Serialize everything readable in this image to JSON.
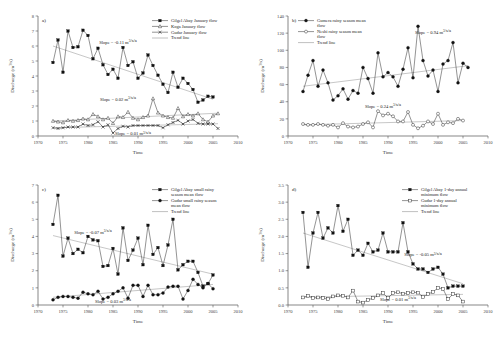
{
  "figure": {
    "axis": {
      "xlabel": "Time",
      "ylabel": "Discharge (m3/s)"
    }
  },
  "chart_data": [
    {
      "type": "line",
      "panel": "a)",
      "title": "",
      "xlabel": "Time",
      "ylabel": "Discharge (m3/s)",
      "xlim": [
        1970,
        2010
      ],
      "ylim": [
        0,
        8
      ],
      "xticks": [
        1970,
        1975,
        1980,
        1985,
        1990,
        1995,
        2000,
        2005,
        2010
      ],
      "yticks": [
        0,
        1,
        2,
        3,
        4,
        5,
        6,
        7,
        8
      ],
      "grid": false,
      "legend_position": "top-right",
      "annotations": [
        {
          "text": "Slope = -0.11 m3/s/a",
          "x": 1986,
          "y": 6.15
        },
        {
          "text": "Slope = 0.02 m3/s/a",
          "x": 1986,
          "y": 2.35
        },
        {
          "text": "Slope = 0.01 m3/s/a",
          "x": 1989,
          "y": 0.05
        }
      ],
      "series": [
        {
          "name": "Gilgel Abay January flow",
          "marker": "filled-square",
          "x": [
            1973,
            1974,
            1975,
            1976,
            1977,
            1978,
            1979,
            1980,
            1981,
            1982,
            1983,
            1984,
            1985,
            1986,
            1987,
            1988,
            1989,
            1990,
            1991,
            1992,
            1993,
            1994,
            1995,
            1996,
            1997,
            1998,
            1999,
            2000,
            2001,
            2002,
            2003,
            2004,
            2005
          ],
          "values": [
            4.9,
            6.4,
            4.25,
            7.0,
            5.9,
            5.95,
            7.05,
            6.7,
            5.15,
            5.85,
            4.75,
            4.1,
            4.45,
            3.85,
            5.9,
            4.7,
            4.95,
            3.85,
            4.2,
            5.4,
            4.7,
            4.05,
            3.45,
            2.9,
            4.25,
            3.25,
            3.85,
            3.5,
            3.1,
            2.25,
            2.4,
            2.65,
            2.6
          ]
        },
        {
          "name": "Koga January flow",
          "marker": "open-triangle",
          "x": [
            1973,
            1974,
            1975,
            1976,
            1977,
            1978,
            1979,
            1980,
            1981,
            1982,
            1983,
            1984,
            1985,
            1986,
            1987,
            1988,
            1989,
            1990,
            1991,
            1992,
            1993,
            1994,
            1995,
            1996,
            1997,
            1998,
            1999,
            2000,
            2001,
            2002,
            2003,
            2004,
            2005,
            2006
          ],
          "values": [
            1.0,
            0.95,
            0.9,
            1.05,
            1.0,
            1.05,
            1.15,
            1.1,
            1.45,
            1.3,
            1.1,
            1.2,
            0.85,
            1.3,
            1.25,
            1.6,
            1.2,
            1.1,
            1.25,
            1.35,
            2.5,
            1.55,
            1.35,
            1.25,
            1.2,
            1.85,
            1.3,
            1.45,
            1.35,
            1.5,
            1.1,
            0.95,
            1.35,
            1.5
          ]
        },
        {
          "name": "Gudar January flow",
          "marker": "cross",
          "x": [
            1973,
            1974,
            1975,
            1976,
            1977,
            1978,
            1979,
            1980,
            1981,
            1982,
            1983,
            1984,
            1985,
            1986,
            1987,
            1988,
            1989,
            1990,
            1991,
            1992,
            1993,
            1994,
            1995,
            1996,
            1997,
            1998,
            1999,
            2000,
            2001,
            2002,
            2003,
            2004,
            2005,
            2006
          ],
          "values": [
            0.55,
            0.5,
            0.55,
            0.6,
            0.6,
            0.6,
            0.8,
            0.7,
            0.75,
            0.95,
            0.6,
            0.75,
            0.2,
            0.5,
            0.65,
            0.6,
            0.7,
            0.7,
            0.7,
            0.7,
            0.7,
            0.7,
            0.55,
            0.75,
            0.9,
            1.05,
            0.8,
            1.0,
            1.1,
            0.85,
            0.8,
            0.8,
            0.8,
            0.5
          ]
        },
        {
          "name": "Trend line",
          "marker": "line-only",
          "x": [],
          "values": []
        }
      ],
      "trendlines": [
        {
          "x": [
            1973,
            2005
          ],
          "y": [
            6.0,
            2.45
          ]
        },
        {
          "x": [
            1973,
            2006
          ],
          "y": [
            1.0,
            1.52
          ]
        },
        {
          "x": [
            1973,
            2006
          ],
          "y": [
            0.55,
            0.82
          ]
        }
      ]
    },
    {
      "type": "line",
      "panel": "b)",
      "title": "",
      "xlabel": "Time",
      "ylabel": "Discharge (m3/s)",
      "xlim": [
        1970,
        2010
      ],
      "ylim": [
        0,
        140
      ],
      "xticks": [
        1970,
        1975,
        1980,
        1985,
        1990,
        1995,
        2000,
        2005,
        2010
      ],
      "yticks": [
        0,
        20,
        40,
        60,
        80,
        100,
        120,
        140
      ],
      "grid": false,
      "legend_position": "top-left",
      "annotations": [
        {
          "text": "Slope = 0.94 m3/s/a",
          "x": 1999,
          "y": 119
        },
        {
          "text": "Slope = 0.24 m3/s/a",
          "x": 1989,
          "y": 33
        }
      ],
      "series": [
        {
          "name": "Gumera rainy season mean flow",
          "marker": "filled-circle",
          "x": [
            1973,
            1974,
            1975,
            1976,
            1977,
            1978,
            1979,
            1980,
            1981,
            1982,
            1983,
            1984,
            1985,
            1986,
            1987,
            1988,
            1989,
            1990,
            1991,
            1992,
            1993,
            1994,
            1995,
            1996,
            1997,
            1998,
            1999,
            2000,
            2001,
            2002,
            2003,
            2004,
            2005,
            2006
          ],
          "values": [
            52,
            71,
            88,
            58,
            77,
            62,
            42,
            47,
            55,
            43,
            53,
            50,
            80,
            67,
            50,
            97,
            69,
            74,
            69,
            58,
            78,
            103,
            68,
            128,
            88,
            70,
            77,
            52,
            84,
            88,
            109,
            62,
            85,
            80
          ]
        },
        {
          "name": "Neshi rainy season mean flow",
          "marker": "open-circle",
          "x": [
            1973,
            1974,
            1975,
            1976,
            1977,
            1978,
            1979,
            1980,
            1981,
            1982,
            1983,
            1984,
            1985,
            1986,
            1987,
            1988,
            1989,
            1990,
            1991,
            1992,
            1993,
            1994,
            1995,
            1996,
            1997,
            1998,
            1999,
            2000,
            2001,
            2002,
            2003,
            2004,
            2005
          ],
          "values": [
            14,
            13,
            13,
            14,
            13,
            12,
            13,
            10,
            15,
            11,
            10,
            11,
            14,
            16,
            10,
            29,
            24,
            26,
            23,
            17,
            17,
            28,
            13,
            9,
            12,
            17,
            14,
            26,
            13,
            16,
            15,
            20,
            18
          ]
        },
        {
          "name": "Trend line",
          "marker": "line-only",
          "x": [],
          "values": []
        }
      ],
      "trendlines": [
        {
          "x": [
            1973,
            2006
          ],
          "y": [
            58,
            82
          ]
        },
        {
          "x": [
            1973,
            2005
          ],
          "y": [
            13,
            18
          ]
        }
      ]
    },
    {
      "type": "line",
      "panel": "c)",
      "title": "",
      "xlabel": "Time",
      "ylabel": "Discharge (m3/s)",
      "xlim": [
        1970,
        2010
      ],
      "ylim": [
        0,
        7
      ],
      "xticks": [
        1970,
        1975,
        1980,
        1985,
        1990,
        1995,
        2000,
        2005,
        2010
      ],
      "yticks": [
        0,
        1,
        2,
        3,
        4,
        5,
        6,
        7
      ],
      "grid": false,
      "legend_position": "top-right",
      "annotations": [
        {
          "text": "Slope = -0.07 m3/s/a",
          "x": 1981,
          "y": 4.15
        },
        {
          "text": "Slope = 0.03 m3/s/a",
          "x": 1985,
          "y": 0.12
        }
      ],
      "series": [
        {
          "name": "Gilgel Abay small rainy season mean flow",
          "marker": "filled-square",
          "x": [
            1973,
            1974,
            1975,
            1976,
            1977,
            1978,
            1979,
            1980,
            1981,
            1982,
            1983,
            1984,
            1985,
            1986,
            1987,
            1988,
            1989,
            1990,
            1991,
            1992,
            1993,
            1994,
            1995,
            1996,
            1997,
            1998,
            1999,
            2000,
            2001,
            2002,
            2003,
            2004,
            2005
          ],
          "values": [
            4.7,
            6.4,
            2.85,
            3.9,
            3.0,
            3.25,
            3.05,
            4.0,
            3.8,
            3.75,
            2.25,
            2.3,
            3.3,
            1.8,
            4.5,
            2.6,
            3.2,
            3.9,
            2.35,
            4.65,
            2.95,
            3.35,
            2.3,
            3.5,
            5.0,
            2.05,
            2.35,
            2.55,
            2.55,
            1.9,
            1.1,
            1.25,
            1.75
          ]
        },
        {
          "name": "Gudar small rainy season mean flow",
          "marker": "filled-circle",
          "x": [
            1973,
            1974,
            1975,
            1976,
            1977,
            1978,
            1979,
            1980,
            1981,
            1982,
            1983,
            1984,
            1985,
            1986,
            1987,
            1988,
            1989,
            1990,
            1991,
            1992,
            1993,
            1994,
            1995,
            1996,
            1997,
            1998,
            1999,
            2000,
            2001,
            2002,
            2003,
            2004,
            2005
          ],
          "values": [
            0.3,
            0.45,
            0.5,
            0.5,
            0.45,
            0.4,
            0.75,
            0.65,
            0.6,
            0.8,
            0.35,
            0.45,
            0.65,
            0.8,
            1.0,
            0.4,
            1.15,
            1.15,
            0.5,
            1.15,
            0.6,
            0.6,
            0.7,
            1.05,
            1.1,
            1.1,
            0.35,
            0.85,
            1.5,
            1.2,
            1.0,
            1.25,
            0.95
          ]
        },
        {
          "name": "Trend line",
          "marker": "line-only",
          "x": [],
          "values": []
        }
      ],
      "trendlines": [
        {
          "x": [
            1973,
            2005
          ],
          "y": [
            4.05,
            1.8
          ]
        },
        {
          "x": [
            1973,
            2005
          ],
          "y": [
            0.45,
            1.2
          ]
        }
      ]
    },
    {
      "type": "line",
      "panel": "d)",
      "title": "",
      "xlabel": "Time",
      "ylabel": "Discharge (m3/s)",
      "xlim": [
        1970,
        2010
      ],
      "ylim": [
        0.0,
        3.5
      ],
      "xticks": [
        1970,
        1975,
        1980,
        1985,
        1990,
        1995,
        2000,
        2005,
        2010
      ],
      "yticks": [
        "0.0",
        "0.5",
        "1.0",
        "1.5",
        "2.0",
        "2.5",
        "3.0",
        "3.5"
      ],
      "grid": false,
      "legend_position": "top-right",
      "annotations": [
        {
          "text": "Slope = -0.05 m3/s/a",
          "x": 1997,
          "y": 1.42
        },
        {
          "text": "Slope = 0.01 m3/s/a",
          "x": 1992,
          "y": 0.12
        }
      ],
      "series": [
        {
          "name": "Gilgel Abay 1-day annual minimum flow",
          "marker": "filled-square",
          "x": [
            1973,
            1974,
            1975,
            1976,
            1977,
            1978,
            1979,
            1980,
            1981,
            1982,
            1983,
            1984,
            1985,
            1986,
            1987,
            1988,
            1989,
            1990,
            1991,
            1992,
            1993,
            1994,
            1995,
            1996,
            1997,
            1998,
            1999,
            2000,
            2001,
            2002,
            2003,
            2004,
            2005
          ],
          "values": [
            2.7,
            1.1,
            2.1,
            2.7,
            1.95,
            2.25,
            2.1,
            2.9,
            2.15,
            2.5,
            1.45,
            1.6,
            1.45,
            1.8,
            1.55,
            1.6,
            2.1,
            1.55,
            1.55,
            1.55,
            2.4,
            1.55,
            1.2,
            1.05,
            1.05,
            0.95,
            1.05,
            1.1,
            0.9,
            0.5,
            0.55,
            0.55,
            0.55
          ]
        },
        {
          "name": "Gudar 1-day annual minimum flow",
          "marker": "open-square",
          "x": [
            1973,
            1974,
            1975,
            1976,
            1977,
            1978,
            1979,
            1980,
            1981,
            1982,
            1983,
            1984,
            1985,
            1986,
            1987,
            1988,
            1989,
            1990,
            1991,
            1992,
            1993,
            1994,
            1995,
            1996,
            1997,
            1998,
            1999,
            2000,
            2001,
            2002,
            2003,
            2004,
            2005
          ],
          "values": [
            0.22,
            0.27,
            0.2,
            0.22,
            0.2,
            0.17,
            0.25,
            0.28,
            0.27,
            0.22,
            0.42,
            0.1,
            0.07,
            0.15,
            0.2,
            0.28,
            0.35,
            0.2,
            0.35,
            0.37,
            0.33,
            0.35,
            0.37,
            0.36,
            0.23,
            0.32,
            0.38,
            0.5,
            0.47,
            0.17,
            0.32,
            0.28,
            0.1
          ]
        },
        {
          "name": "Trend line",
          "marker": "line-only",
          "x": [],
          "values": []
        }
      ],
      "trendlines": [
        {
          "x": [
            1973,
            2005
          ],
          "y": [
            2.1,
            0.62
          ]
        },
        {
          "x": [
            1973,
            2005
          ],
          "y": [
            0.23,
            0.31
          ]
        }
      ]
    }
  ]
}
